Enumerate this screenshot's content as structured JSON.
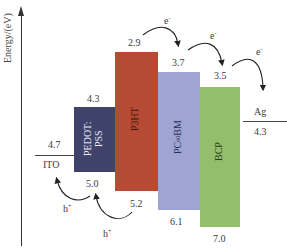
{
  "axis": {
    "label": "Energy/(eV)"
  },
  "electrodes": [
    {
      "name": "ITO",
      "level": "4.7"
    },
    {
      "name": "Ag",
      "level": "4.3"
    }
  ],
  "layers": [
    {
      "name_line1": "PEDOT:",
      "name_line2": "PSS",
      "lumo": "4.3",
      "homo": "5.0",
      "color": "#3f426b"
    },
    {
      "name": "P3HT",
      "lumo": "2.9",
      "homo": "5.2",
      "color": "#b64a32"
    },
    {
      "name_main": "PC",
      "name_sub": "60",
      "name_tail": "BM",
      "lumo": "3.7",
      "homo": "6.1",
      "color": "#9ea5d2"
    },
    {
      "name": "BCP",
      "lumo": "3.5",
      "homo": "7.0",
      "color": "#93be6c"
    }
  ],
  "carriers": {
    "electron": "e",
    "electron_sup": "-",
    "hole": "h",
    "hole_sup": "+"
  }
}
